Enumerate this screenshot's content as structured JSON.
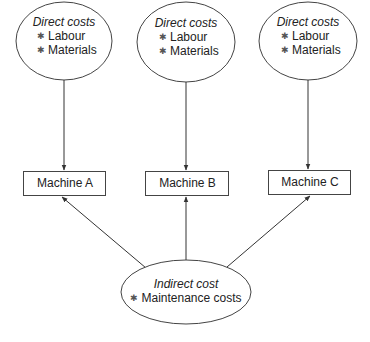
{
  "diagram": {
    "direct_nodes": [
      {
        "title": "Direct costs",
        "items": [
          "Labour",
          "Materials"
        ]
      },
      {
        "title": "Direct costs",
        "items": [
          "Labour",
          "Materials"
        ]
      },
      {
        "title": "Direct costs",
        "items": [
          "Labour",
          "Materials"
        ]
      }
    ],
    "machines": [
      {
        "label": "Machine A"
      },
      {
        "label": "Machine B"
      },
      {
        "label": "Machine C"
      }
    ],
    "indirect_node": {
      "title": "Indirect cost",
      "items": [
        "Maintenance costs"
      ]
    },
    "bullet_symbol": "*",
    "colors": {
      "stroke": "#333333",
      "text": "#222222",
      "background": "#ffffff"
    }
  }
}
